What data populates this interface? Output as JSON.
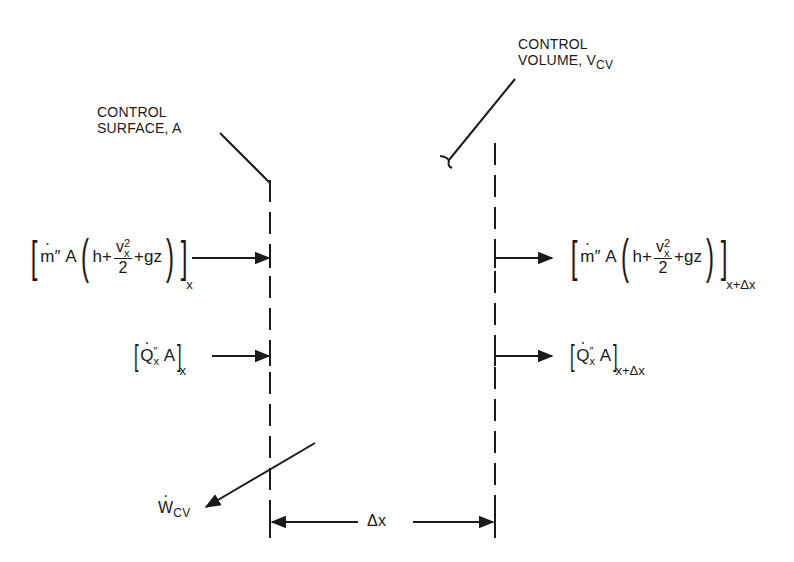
{
  "diagram": {
    "type": "control-volume-energy-balance",
    "labels": {
      "control_surface": {
        "line1": "CONTROL",
        "line2": "SURFACE, A"
      },
      "control_volume": {
        "line1": "CONTROL",
        "line2": "VOLUME, V",
        "line2_sub": "CV"
      },
      "work": {
        "symbol": "W",
        "sub": "CV"
      },
      "delta_x": "Δx"
    },
    "flows": {
      "enthalpy_in": {
        "m": "m",
        "mpp": "″",
        "A": "A",
        "h": "h+",
        "v": "v",
        "v_sup": "2",
        "v_sub": "x",
        "den": "2",
        "gz": "+gz",
        "outer_sub": "x"
      },
      "enthalpy_out": {
        "m": "m",
        "mpp": "″",
        "A": "A",
        "h": "h+",
        "v": "v",
        "v_sup": "2",
        "v_sub": "x",
        "den": "2",
        "gz": "+gz",
        "outer_sub": "x+Δx"
      },
      "heat_in": {
        "Q": "Q",
        "Q_sup": "″",
        "Q_sub": "x",
        "A": "A",
        "outer_sub": "x"
      },
      "heat_out": {
        "Q": "Q",
        "Q_sup": "″",
        "Q_sub": "x",
        "A": "A",
        "outer_sub": "x+Δx"
      }
    },
    "colors": {
      "ink": "#1a1a1a",
      "background": "#ffffff"
    }
  }
}
